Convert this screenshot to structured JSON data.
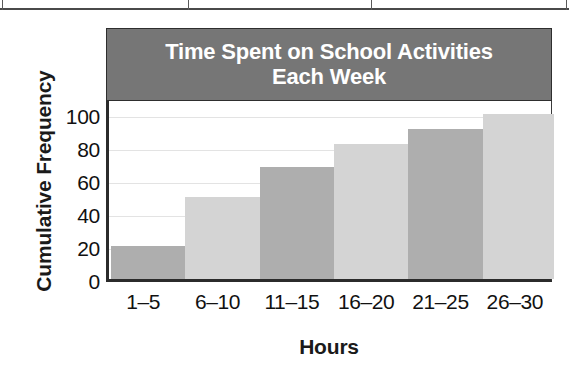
{
  "figure": {
    "table_fragment_label": "table-border-fragment"
  },
  "chart_data": {
    "type": "bar",
    "title": "Time Spent on School Activities Each Week",
    "title_line1": "Time Spent on School Activities",
    "title_line2": "Each Week",
    "xlabel": "Hours",
    "ylabel": "Cumulative Frequency",
    "categories": [
      "1–5",
      "6–10",
      "11–15",
      "16–20",
      "21–25",
      "26–30"
    ],
    "values": [
      20,
      50,
      68,
      82,
      91,
      100
    ],
    "ylim": [
      0,
      110
    ],
    "yticks": [
      0,
      20,
      40,
      60,
      80,
      100
    ],
    "ytick_labels": [
      "0",
      "20",
      "40",
      "60",
      "80",
      "100"
    ],
    "grid": true,
    "legend": "none",
    "bar_colors": [
      "#aeaeae",
      "#d4d4d4",
      "#aeaeae",
      "#d4d4d4",
      "#aeaeae",
      "#d4d4d4"
    ],
    "colors": {
      "title_banner": "#767676",
      "title_text": "#ffffff",
      "bar_dark": "#aeaeae",
      "bar_light": "#d4d4d4",
      "gridline": "#e3e3e3",
      "axis": "#2b2b2b",
      "plot_background": "#ffffff",
      "label_text": "#111111"
    }
  }
}
